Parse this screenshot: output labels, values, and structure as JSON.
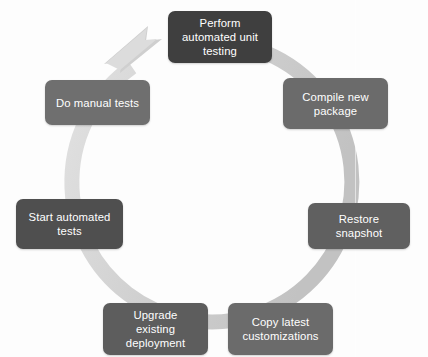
{
  "diagram": {
    "type": "cycle",
    "direction": "clockwise",
    "title": "",
    "ring": {
      "color_light": "#d9d9d9",
      "color_mid": "#c8c8c8",
      "arrow_name": "cycle-arrowhead",
      "arrow_position": "top-left"
    },
    "steps": [
      {
        "id": "perform",
        "label": "Perform\nautomated unit\ntesting",
        "order": 1,
        "color": "#3f3f3f",
        "position": "top"
      },
      {
        "id": "compile",
        "label": "Compile new\npackage",
        "order": 2,
        "color": "#6b6b6b",
        "position": "top-right"
      },
      {
        "id": "restore",
        "label": "Restore snapshot",
        "order": 3,
        "color": "#606060",
        "position": "right"
      },
      {
        "id": "copy",
        "label": "Copy latest\ncustomizations",
        "order": 4,
        "color": "#6b6b6b",
        "position": "bottom-right"
      },
      {
        "id": "upgrade",
        "label": "Upgrade\nexisting deployment",
        "order": 5,
        "color": "#5d5d5d",
        "position": "bottom-left"
      },
      {
        "id": "start",
        "label": "Start automated\ntests",
        "order": 6,
        "color": "#4f4f4f",
        "position": "left"
      },
      {
        "id": "domanual",
        "label": "Do manual tests",
        "order": 7,
        "color": "#6f6f6f",
        "position": "top-left"
      }
    ]
  }
}
